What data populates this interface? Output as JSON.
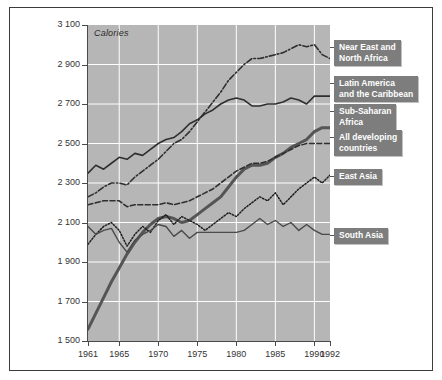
{
  "page": {
    "top_fragment": "",
    "frame_color": "#3b3b3b",
    "plot_bg": "#b6b6b6",
    "grid_color": "#ffffff",
    "legend_bg": "#7d7d7d",
    "legend_text_color": "#ffffff"
  },
  "chart_data": {
    "type": "line",
    "title": "",
    "unit_label": "Calories",
    "xlabel": "",
    "ylabel": "Calories",
    "xlim": [
      1961,
      1992
    ],
    "ylim": [
      1500,
      3100
    ],
    "ytick_step": 200,
    "grid": true,
    "legend_position": "right-callouts",
    "yticks": [
      "3 100",
      "2 900",
      "2 700",
      "2 500",
      "2 300",
      "2 100",
      "1 900",
      "1 700",
      "1 500"
    ],
    "ytick_values": [
      3100,
      2900,
      2700,
      2500,
      2300,
      2100,
      1900,
      1700,
      1500
    ],
    "xticks": [
      "1961",
      "1965",
      "1970",
      "1975",
      "1980",
      "1985",
      "1990",
      "1992"
    ],
    "xtick_values": [
      1961,
      1965,
      1970,
      1975,
      1980,
      1985,
      1990,
      1992
    ],
    "x": [
      1961,
      1962,
      1963,
      1964,
      1965,
      1966,
      1967,
      1968,
      1969,
      1970,
      1971,
      1972,
      1973,
      1974,
      1975,
      1976,
      1977,
      1978,
      1979,
      1980,
      1981,
      1982,
      1983,
      1984,
      1985,
      1986,
      1987,
      1988,
      1989,
      1990,
      1991,
      1992
    ],
    "series": [
      {
        "name": "Near East and North Africa",
        "style": "dash-dot",
        "color": "#2f2f2f",
        "width": 1.6,
        "values": [
          2230,
          2250,
          2280,
          2300,
          2300,
          2290,
          2330,
          2360,
          2390,
          2420,
          2460,
          2500,
          2520,
          2560,
          2610,
          2660,
          2710,
          2760,
          2820,
          2860,
          2900,
          2930,
          2930,
          2940,
          2950,
          2960,
          2980,
          3000,
          2990,
          3000,
          2950,
          2930
        ]
      },
      {
        "name": "Latin America and the Caribbean",
        "style": "solid",
        "color": "#2f2f2f",
        "width": 1.6,
        "values": [
          2350,
          2390,
          2370,
          2400,
          2430,
          2420,
          2450,
          2440,
          2470,
          2500,
          2520,
          2530,
          2560,
          2600,
          2620,
          2650,
          2670,
          2700,
          2720,
          2730,
          2720,
          2690,
          2690,
          2700,
          2700,
          2710,
          2730,
          2720,
          2700,
          2740,
          2740,
          2740
        ]
      },
      {
        "name": "Sub-Saharan Africa",
        "style": "thick-solid",
        "color": "#555555",
        "width": 3.0,
        "values": [
          1560,
          1640,
          1720,
          1800,
          1870,
          1940,
          2000,
          2050,
          2090,
          2120,
          2130,
          2120,
          2100,
          2110,
          2140,
          2170,
          2200,
          2230,
          2280,
          2330,
          2370,
          2390,
          2390,
          2400,
          2430,
          2450,
          2480,
          2500,
          2520,
          2560,
          2580,
          2580
        ]
      },
      {
        "name": "All developing countries",
        "style": "dashed",
        "color": "#2f2f2f",
        "width": 1.6,
        "values": [
          2190,
          2200,
          2210,
          2210,
          2210,
          2180,
          2190,
          2190,
          2190,
          2190,
          2200,
          2190,
          2200,
          2210,
          2230,
          2250,
          2270,
          2300,
          2330,
          2360,
          2380,
          2400,
          2400,
          2410,
          2430,
          2450,
          2470,
          2490,
          2500,
          2500,
          2500,
          2500
        ]
      },
      {
        "name": "East Asia",
        "style": "dotted",
        "color": "#1f1f1f",
        "width": 1.5,
        "values": [
          1990,
          2040,
          2080,
          2100,
          2060,
          1980,
          2040,
          2080,
          2050,
          2110,
          2140,
          2090,
          2130,
          2110,
          2090,
          2060,
          2090,
          2120,
          2150,
          2130,
          2170,
          2200,
          2230,
          2210,
          2250,
          2190,
          2230,
          2270,
          2300,
          2330,
          2300,
          2340
        ]
      },
      {
        "name": "South Asia",
        "style": "solid-thin",
        "color": "#4a4a4a",
        "width": 1.4,
        "values": [
          2080,
          2040,
          2060,
          2070,
          2000,
          1950,
          2010,
          2040,
          2060,
          2090,
          2080,
          2030,
          2060,
          2020,
          2050,
          2050,
          2050,
          2050,
          2050,
          2050,
          2060,
          2090,
          2120,
          2090,
          2110,
          2080,
          2100,
          2060,
          2090,
          2060,
          2040,
          2040
        ]
      }
    ]
  },
  "legend": [
    {
      "label": "Near East and\nNorth Africa",
      "top": 40,
      "left": 334
    },
    {
      "label": "Latin America\nand the Caribbean",
      "top": 76,
      "left": 334
    },
    {
      "label": "Sub-Saharan\nAfrica",
      "top": 104,
      "left": 334
    },
    {
      "label": "All developing\ncountries",
      "top": 130,
      "left": 334
    },
    {
      "label": "East Asia",
      "top": 169,
      "left": 334
    },
    {
      "label": "South Asia",
      "top": 228,
      "left": 334
    }
  ]
}
